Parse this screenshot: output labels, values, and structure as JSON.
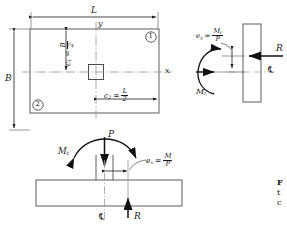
{
  "figure": {
    "plan_view": {
      "dim_length_label": "L",
      "dim_width_label": "B",
      "axis_y_label": "y",
      "axis_x_label": "x",
      "c1_label": "c",
      "c1_sub": "1",
      "c1_equals": "=",
      "c1_num": "B",
      "c1_den": "2",
      "c2_label": "c",
      "c2_sub": "2",
      "c2_equals": "=",
      "c2_num": "L",
      "c2_den": "2",
      "corner_marker_1": "1",
      "corner_marker_2": "2"
    },
    "right_view": {
      "reaction_label": "R",
      "centerline_label": "℄",
      "moment_label": "M",
      "moment_sub": "t",
      "eccentricity_label": "e",
      "eccentricity_sub": "y",
      "eccentricity_equals": "=",
      "eccentricity_num": "M",
      "eccentricity_num_sub": "t",
      "eccentricity_den": "P"
    },
    "bottom_view": {
      "load_label": "P",
      "moment_label": "M",
      "moment_sub": "t",
      "reaction_label": "R",
      "centerline_label": "℄",
      "eccentricity_label": "e",
      "eccentricity_sub": "x",
      "eccentricity_equals": "=",
      "eccentricity_num": "M",
      "eccentricity_den": "P"
    },
    "caption": {
      "line1": "F",
      "line2": "t",
      "line3": "c"
    },
    "colors": {
      "line": "#1a1a1a",
      "thin": "#555555",
      "centerline": "#9a9a9a",
      "background": "#ffffff"
    }
  }
}
